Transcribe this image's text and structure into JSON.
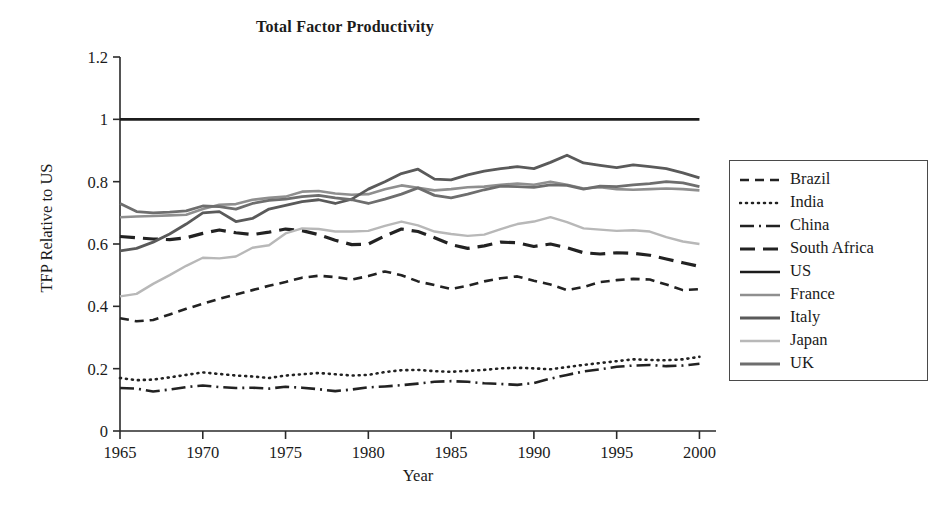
{
  "chart_data": {
    "type": "line",
    "title": "Total Factor Productivity",
    "xlabel": "Year",
    "ylabel": "TFP Relative to US",
    "xlim": [
      1965,
      2001
    ],
    "ylim": [
      0,
      1.2
    ],
    "xticks": [
      "1965",
      "1970",
      "1975",
      "1980",
      "1985",
      "1990",
      "1995",
      "2000"
    ],
    "xtick_values": [
      1965,
      1970,
      1975,
      1980,
      1985,
      1990,
      1995,
      2000
    ],
    "yticks": [
      "0",
      "0.2",
      "0.4",
      "0.6",
      "0.8",
      "1",
      "1.2"
    ],
    "ytick_values": [
      0,
      0.2,
      0.4,
      0.6,
      0.8,
      1,
      1.2
    ],
    "grid": false,
    "legend_position": "right-outside",
    "x": [
      1965,
      1966,
      1967,
      1968,
      1969,
      1970,
      1971,
      1972,
      1973,
      1974,
      1975,
      1976,
      1977,
      1978,
      1979,
      1980,
      1981,
      1982,
      1983,
      1984,
      1985,
      1986,
      1987,
      1988,
      1989,
      1990,
      1991,
      1992,
      1993,
      1994,
      1995,
      1996,
      1997,
      1998,
      1999,
      2000
    ],
    "series": [
      {
        "name": "Brazil",
        "style": "dashed",
        "color": "#222222",
        "width": 2.6,
        "dash": "9,6",
        "values": [
          0.362,
          0.352,
          0.356,
          0.374,
          0.392,
          0.408,
          0.424,
          0.438,
          0.452,
          0.466,
          0.478,
          0.492,
          0.498,
          0.494,
          0.486,
          0.497,
          0.512,
          0.5,
          0.48,
          0.468,
          0.456,
          0.466,
          0.48,
          0.49,
          0.496,
          0.482,
          0.47,
          0.452,
          0.462,
          0.478,
          0.484,
          0.488,
          0.486,
          0.47,
          0.452,
          0.455
        ]
      },
      {
        "name": "India",
        "style": "dotted",
        "color": "#222222",
        "width": 2.6,
        "dash": "1,5",
        "values": [
          0.17,
          0.163,
          0.165,
          0.172,
          0.18,
          0.188,
          0.183,
          0.178,
          0.175,
          0.17,
          0.178,
          0.182,
          0.186,
          0.182,
          0.178,
          0.18,
          0.189,
          0.195,
          0.196,
          0.192,
          0.19,
          0.193,
          0.196,
          0.201,
          0.203,
          0.201,
          0.198,
          0.205,
          0.212,
          0.218,
          0.224,
          0.23,
          0.228,
          0.227,
          0.23,
          0.238
        ]
      },
      {
        "name": "China",
        "style": "dashdot",
        "color": "#222222",
        "width": 2.6,
        "dash": "14,5,2,5",
        "values": [
          0.138,
          0.136,
          0.127,
          0.133,
          0.141,
          0.146,
          0.141,
          0.138,
          0.139,
          0.136,
          0.142,
          0.139,
          0.134,
          0.128,
          0.133,
          0.14,
          0.143,
          0.147,
          0.152,
          0.158,
          0.16,
          0.158,
          0.153,
          0.151,
          0.148,
          0.154,
          0.168,
          0.18,
          0.191,
          0.198,
          0.206,
          0.21,
          0.212,
          0.208,
          0.21,
          0.216
        ]
      },
      {
        "name": "South Africa",
        "style": "longdash",
        "color": "#222222",
        "width": 3.2,
        "dash": "15,8",
        "values": [
          0.624,
          0.62,
          0.616,
          0.614,
          0.62,
          0.634,
          0.645,
          0.636,
          0.63,
          0.638,
          0.648,
          0.643,
          0.63,
          0.612,
          0.598,
          0.6,
          0.626,
          0.648,
          0.64,
          0.62,
          0.598,
          0.586,
          0.594,
          0.606,
          0.604,
          0.592,
          0.6,
          0.588,
          0.572,
          0.568,
          0.572,
          0.57,
          0.564,
          0.552,
          0.54,
          0.528
        ]
      },
      {
        "name": "US",
        "style": "solid",
        "color": "#1c1c1c",
        "width": 2.6,
        "dash": "",
        "values": [
          1,
          1,
          1,
          1,
          1,
          1,
          1,
          1,
          1,
          1,
          1,
          1,
          1,
          1,
          1,
          1,
          1,
          1,
          1,
          1,
          1,
          1,
          1,
          1,
          1,
          1,
          1,
          1,
          1,
          1,
          1,
          1,
          1,
          1,
          1,
          1
        ]
      },
      {
        "name": "France",
        "style": "solid",
        "color": "#8f8f8f",
        "width": 2.6,
        "dash": "",
        "values": [
          0.686,
          0.688,
          0.69,
          0.692,
          0.694,
          0.712,
          0.726,
          0.728,
          0.742,
          0.748,
          0.752,
          0.768,
          0.77,
          0.762,
          0.758,
          0.76,
          0.776,
          0.788,
          0.78,
          0.772,
          0.776,
          0.782,
          0.784,
          0.79,
          0.794,
          0.79,
          0.8,
          0.79,
          0.778,
          0.782,
          0.776,
          0.774,
          0.776,
          0.778,
          0.776,
          0.772
        ]
      },
      {
        "name": "Italy",
        "style": "solid",
        "color": "#5a5a5a",
        "width": 2.8,
        "dash": "",
        "values": [
          0.578,
          0.586,
          0.606,
          0.632,
          0.664,
          0.7,
          0.704,
          0.672,
          0.682,
          0.712,
          0.724,
          0.736,
          0.742,
          0.73,
          0.744,
          0.776,
          0.8,
          0.826,
          0.84,
          0.808,
          0.806,
          0.822,
          0.834,
          0.842,
          0.848,
          0.842,
          0.862,
          0.885,
          0.86,
          0.852,
          0.845,
          0.854,
          0.848,
          0.842,
          0.828,
          0.812
        ]
      },
      {
        "name": "Japan",
        "style": "solid",
        "color": "#b8b8b8",
        "width": 2.4,
        "dash": "",
        "values": [
          0.432,
          0.44,
          0.472,
          0.5,
          0.53,
          0.556,
          0.554,
          0.56,
          0.588,
          0.596,
          0.634,
          0.65,
          0.648,
          0.64,
          0.64,
          0.642,
          0.658,
          0.672,
          0.66,
          0.64,
          0.632,
          0.626,
          0.63,
          0.648,
          0.664,
          0.672,
          0.686,
          0.67,
          0.65,
          0.646,
          0.642,
          0.644,
          0.64,
          0.622,
          0.608,
          0.6
        ]
      },
      {
        "name": "UK",
        "style": "solid",
        "color": "#6e6e6e",
        "width": 2.8,
        "dash": "",
        "values": [
          0.73,
          0.704,
          0.7,
          0.702,
          0.706,
          0.722,
          0.72,
          0.712,
          0.73,
          0.74,
          0.744,
          0.752,
          0.756,
          0.748,
          0.742,
          0.73,
          0.744,
          0.76,
          0.78,
          0.756,
          0.748,
          0.76,
          0.774,
          0.786,
          0.784,
          0.782,
          0.79,
          0.788,
          0.776,
          0.786,
          0.784,
          0.79,
          0.794,
          0.8,
          0.796,
          0.784
        ]
      }
    ]
  },
  "legend": {
    "items": [
      {
        "label": "Brazil"
      },
      {
        "label": "India"
      },
      {
        "label": "China"
      },
      {
        "label": "South Africa"
      },
      {
        "label": "US"
      },
      {
        "label": "France"
      },
      {
        "label": "Italy"
      },
      {
        "label": "Japan"
      },
      {
        "label": "UK"
      }
    ]
  }
}
